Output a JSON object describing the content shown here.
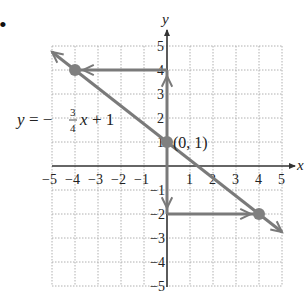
{
  "bullet": "•",
  "chart_data": {
    "type": "line",
    "title": "",
    "xlabel": "x",
    "ylabel": "y",
    "xlim": [
      -5,
      5
    ],
    "ylim": [
      -5,
      5
    ],
    "grid": true,
    "x_ticks": [
      "-5",
      "-4",
      "-3",
      "-2",
      "-1",
      "1",
      "2",
      "3",
      "4",
      "5"
    ],
    "y_ticks": [
      "5",
      "4",
      "3",
      "2",
      "1",
      "-1",
      "-2",
      "-3",
      "-4",
      "-5"
    ],
    "equation": {
      "lhs": "y = −",
      "num": "3",
      "den": "4",
      "rhs": "x + 1"
    },
    "line": {
      "slope": -0.75,
      "intercept": 1,
      "from": [
        -5,
        4.75
      ],
      "to": [
        5,
        -2.75
      ]
    },
    "points": [
      {
        "x": -4,
        "y": 4,
        "label": ""
      },
      {
        "x": 0,
        "y": 1,
        "label": "(0, 1)"
      },
      {
        "x": 4,
        "y": -2,
        "label": ""
      }
    ],
    "guide_arrows": [
      {
        "from": [
          0,
          4
        ],
        "to": [
          -4,
          4
        ],
        "note": "horizontal from y=4 to point"
      },
      {
        "from": [
          0,
          1
        ],
        "to": [
          0,
          4
        ],
        "note": "vertical up from intercept"
      },
      {
        "from": [
          0,
          1
        ],
        "to": [
          0,
          -2
        ],
        "note": "vertical down from intercept"
      },
      {
        "from": [
          0,
          -2
        ],
        "to": [
          4,
          -2
        ],
        "note": "horizontal from y=-2 to point"
      }
    ],
    "colors": {
      "line": "#7a7a7a",
      "axis": "#333333",
      "grid": "#b0b0b0",
      "point": "#808080"
    }
  }
}
